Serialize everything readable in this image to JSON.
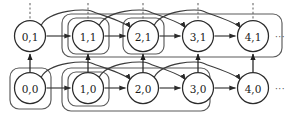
{
  "figure": {
    "kind": "state-transition-lattice",
    "background_color": "#ffffff",
    "stroke_color": "#3c3c3c",
    "node_stroke_color": "#2b2b2b",
    "box_stroke_color": "#555555",
    "label_color": "#1a1a1a",
    "width": 290,
    "height": 118
  },
  "rows": {
    "top": {
      "name": "row-layer-1",
      "y": 36,
      "ellipsis": "···",
      "nodes": [
        {
          "id": "n01",
          "label": "0,1",
          "x": 30,
          "y": 36,
          "r": 15.5
        },
        {
          "id": "n11",
          "label": "1,1",
          "x": 88,
          "y": 36,
          "r": 15.5
        },
        {
          "id": "n21",
          "label": "2,1",
          "x": 143,
          "y": 36,
          "r": 15.5
        },
        {
          "id": "n31",
          "label": "3,1",
          "x": 198,
          "y": 36,
          "r": 15.5
        },
        {
          "id": "n41",
          "label": "4,1",
          "x": 253,
          "y": 36,
          "r": 15.5
        }
      ]
    },
    "bottom": {
      "name": "row-layer-0",
      "y": 88,
      "ellipsis": "···",
      "nodes": [
        {
          "id": "n00",
          "label": "0,0",
          "x": 30,
          "y": 88,
          "r": 15.5
        },
        {
          "id": "n10",
          "label": "1,0",
          "x": 88,
          "y": 88,
          "r": 15.5
        },
        {
          "id": "n20",
          "label": "2,0",
          "x": 143,
          "y": 88,
          "r": 15.5
        },
        {
          "id": "n30",
          "label": "3,0",
          "x": 198,
          "y": 88,
          "r": 15.5
        },
        {
          "id": "n40",
          "label": "4,0",
          "x": 253,
          "y": 88,
          "r": 15.5
        }
      ]
    }
  },
  "group_boxes": [
    {
      "name": "group-box-top-outer",
      "x": 62,
      "y": 14,
      "w": 220,
      "h": 43,
      "rx": 9
    },
    {
      "name": "group-box-node-1-1",
      "x": 68,
      "y": 18,
      "w": 41,
      "h": 36,
      "rx": 8
    },
    {
      "name": "group-box-node-2-1",
      "x": 123,
      "y": 18,
      "w": 41,
      "h": 36,
      "rx": 8
    },
    {
      "name": "group-box-bottom-outer",
      "x": 62,
      "y": 68,
      "w": 148,
      "h": 43,
      "rx": 9
    },
    {
      "name": "group-box-node-0-0",
      "x": 10,
      "y": 68,
      "w": 41,
      "h": 41,
      "rx": 9
    },
    {
      "name": "group-box-node-1-0",
      "x": 68,
      "y": 72,
      "w": 41,
      "h": 34,
      "rx": 8
    }
  ],
  "dashed_verticals": [
    {
      "name": "dashed-tick-0-1",
      "x": 30,
      "y_top": 3,
      "y_bottom": 20
    },
    {
      "name": "dashed-tick-1-1",
      "x": 88,
      "y_top": 3,
      "y_bottom": 20
    },
    {
      "name": "dashed-tick-2-1",
      "x": 143,
      "y_top": 3,
      "y_bottom": 20
    },
    {
      "name": "dashed-tick-3-1",
      "x": 198,
      "y_top": 3,
      "y_bottom": 20
    },
    {
      "name": "dashed-tick-4-1",
      "x": 253,
      "y_top": 3,
      "y_bottom": 20
    }
  ],
  "edges": {
    "top_sequential": [
      {
        "name": "edge-0-1-to-1-1",
        "from": "0,1",
        "to": "1,1"
      },
      {
        "name": "edge-1-1-to-2-1",
        "from": "1,1",
        "to": "2,1"
      },
      {
        "name": "edge-2-1-to-3-1",
        "from": "2,1",
        "to": "3,1"
      },
      {
        "name": "edge-3-1-to-4-1",
        "from": "3,1",
        "to": "4,1"
      }
    ],
    "bottom_sequential": [
      {
        "name": "edge-0-0-to-1-0",
        "from": "0,0",
        "to": "1,0"
      },
      {
        "name": "edge-1-0-to-2-0",
        "from": "1,0",
        "to": "2,0"
      },
      {
        "name": "edge-2-0-to-3-0",
        "from": "2,0",
        "to": "3,0"
      },
      {
        "name": "edge-3-0-to-4-0",
        "from": "3,0",
        "to": "4,0"
      }
    ],
    "top_skip_arcs": [
      {
        "name": "arc-0-1-to-2-1",
        "from": "0,1",
        "to": "2,1"
      },
      {
        "name": "arc-1-1-to-3-1",
        "from": "1,1",
        "to": "3,1"
      },
      {
        "name": "arc-2-1-to-4-1",
        "from": "2,1",
        "to": "4,1"
      }
    ],
    "bottom_skip_arcs": [
      {
        "name": "arc-0-0-to-2-0",
        "from": "0,0",
        "to": "2,0"
      },
      {
        "name": "arc-1-0-to-3-0",
        "from": "1,0",
        "to": "3,0"
      },
      {
        "name": "arc-2-0-to-4-0",
        "from": "2,0",
        "to": "4,0"
      }
    ],
    "vertical_up": [
      {
        "name": "edge-0-0-to-0-1",
        "from": "0,0",
        "to": "0,1",
        "x": 30
      },
      {
        "name": "edge-1-0-to-1-1",
        "from": "1,0",
        "to": "1,1",
        "x": 88
      },
      {
        "name": "edge-2-0-to-2-1",
        "from": "2,0",
        "to": "2,1",
        "x": 143
      },
      {
        "name": "edge-3-0-to-3-1",
        "from": "3,0",
        "to": "3,1",
        "x": 198
      },
      {
        "name": "edge-4-0-to-4-1",
        "from": "4,0",
        "to": "4,1",
        "x": 253
      }
    ]
  }
}
